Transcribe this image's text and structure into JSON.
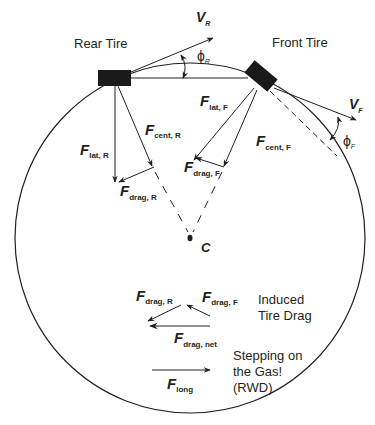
{
  "labels": {
    "rear_tire": "Rear Tire",
    "front_tire": "Front Tire",
    "v_rear": {
      "main": "V",
      "sub": "R"
    },
    "v_front": {
      "main": "V",
      "sub": "F"
    },
    "phi_rear": {
      "main": "ϕ",
      "sub": "R"
    },
    "phi_front": {
      "main": "ϕ",
      "sub": "F"
    },
    "f_lat_rear": {
      "main": "F",
      "sub": "lat, R"
    },
    "f_cent_rear": {
      "main": "F",
      "sub": "cent, R"
    },
    "f_drag_rear": {
      "main": "F",
      "sub": "drag, R"
    },
    "f_lat_front": {
      "main": "F",
      "sub": "lat, F"
    },
    "f_cent_front": {
      "main": "F",
      "sub": "cent, F"
    },
    "f_drag_front": {
      "main": "F",
      "sub": "drag, F"
    },
    "center": "C",
    "inset_drag_rear": {
      "main": "F",
      "sub": "drag, R"
    },
    "inset_drag_front": {
      "main": "F",
      "sub": "drag, F"
    },
    "inset_drag_net": {
      "main": "F",
      "sub": "drag, net"
    },
    "induced_drag": [
      "Induced",
      "Tire Drag"
    ],
    "f_long": {
      "main": "F",
      "sub": "long"
    },
    "gas_note": [
      "Stepping on",
      "the Gas!",
      "(RWD)"
    ]
  },
  "colors": {
    "stroke": "#231f20",
    "tire": "#1a1a1a",
    "text": "#231f20"
  }
}
